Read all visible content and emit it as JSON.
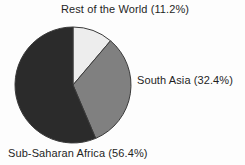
{
  "chart_data": {
    "type": "pie",
    "title": "",
    "subtitle": "",
    "xlabel": "",
    "ylabel": "",
    "grid": false,
    "legend_position": "none",
    "label_format": "{name} ({value}%)",
    "start_angle_deg": 0,
    "direction": "clockwise",
    "categories": [
      "Rest of the World",
      "South Asia",
      "Sub-Saharan Africa"
    ],
    "values": [
      11.2,
      32.4,
      56.4
    ],
    "units": "percent",
    "total": 100.0,
    "slices": [
      {
        "name": "Rest of the World",
        "value": 11.2,
        "label": "Rest of the World (11.2%)",
        "color": "#ededed",
        "edge_color": "#3a3a3a",
        "start_deg": 0.0,
        "end_deg": 40.3,
        "label_position": "top"
      },
      {
        "name": "South Asia",
        "value": 32.4,
        "label": "South Asia (32.4%)",
        "color": "#808080",
        "edge_color": "#3a3a3a",
        "start_deg": 40.3,
        "end_deg": 157.0,
        "label_position": "right"
      },
      {
        "name": "Sub-Saharan Africa",
        "value": 56.4,
        "label": "Sub-Saharan Africa (56.4%)",
        "color": "#2b2b2b",
        "edge_color": "#3a3a3a",
        "start_deg": 157.0,
        "end_deg": 360.0,
        "label_position": "bottom"
      }
    ]
  },
  "labels": {
    "rest_of_world": "Rest of the World (11.2%)",
    "south_asia": "South Asia (32.4%)",
    "sub_saharan_africa": "Sub-Saharan Africa (56.4%)"
  }
}
